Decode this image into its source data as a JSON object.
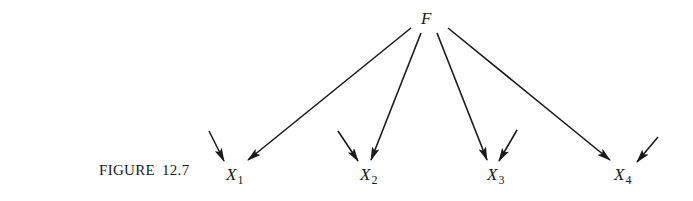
{
  "figure": {
    "caption_label": "FIGURE",
    "caption_number": "12.7"
  },
  "factor": {
    "label": "F"
  },
  "indicators": [
    {
      "label": "X",
      "subscript": "1"
    },
    {
      "label": "X",
      "subscript": "2"
    },
    {
      "label": "X",
      "subscript": "3"
    },
    {
      "label": "X",
      "subscript": "4"
    }
  ],
  "edges": [
    {
      "from": "F",
      "to": "X1",
      "type": "loading"
    },
    {
      "from": "F",
      "to": "X2",
      "type": "loading"
    },
    {
      "from": "F",
      "to": "X3",
      "type": "loading"
    },
    {
      "from": "F",
      "to": "X4",
      "type": "loading"
    },
    {
      "from": "error",
      "to": "X1",
      "type": "error"
    },
    {
      "from": "error",
      "to": "X2",
      "type": "error"
    },
    {
      "from": "error",
      "to": "X3",
      "type": "error"
    },
    {
      "from": "error",
      "to": "X4",
      "type": "error"
    }
  ],
  "colors": {
    "ink": "#1a1a1a",
    "background": "#ffffff"
  }
}
